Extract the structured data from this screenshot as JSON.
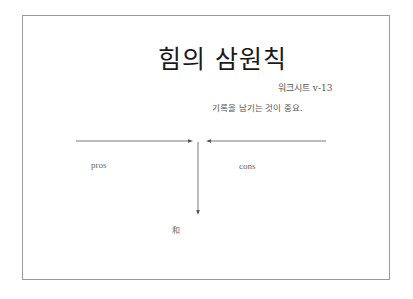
{
  "slide": {
    "title": "힘의 삼원칙",
    "subtitle": "워크시트 v-13",
    "note": "기록을 남기는 것이 중요.",
    "diagram": {
      "left_label": "pros",
      "right_label": "cons",
      "result_label": "和",
      "line_color": "#555555"
    }
  }
}
